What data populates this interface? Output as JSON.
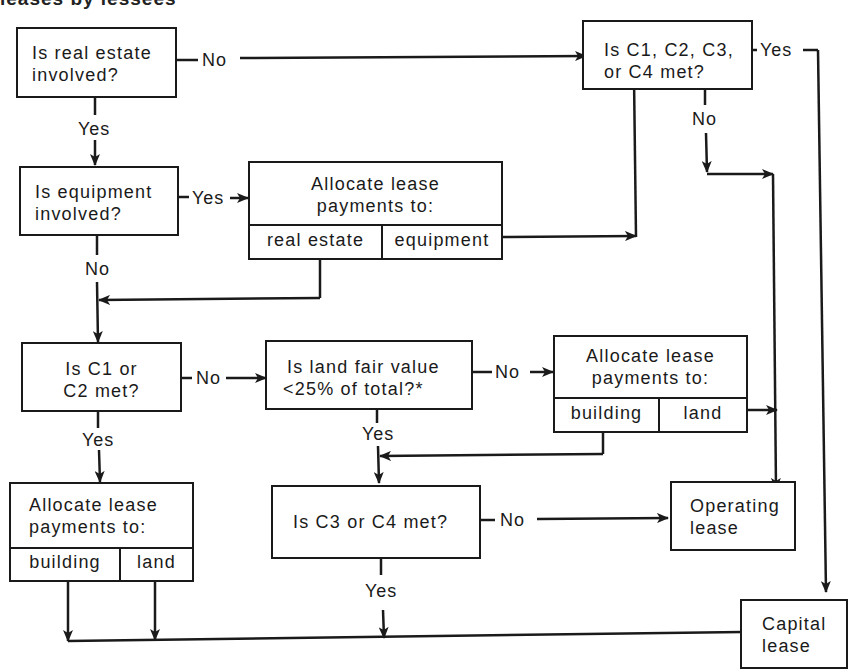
{
  "title_fragment": "leases by lessees",
  "nodes": {
    "real_estate": {
      "line1": "Is real estate",
      "line2": "involved?"
    },
    "c1_c4": {
      "line1": "Is C1, C2, C3,",
      "line2": "or C4 met?"
    },
    "equipment": {
      "line1": "Is equipment",
      "line2": "involved?"
    },
    "alloc_re_eq": {
      "line1": "Allocate lease",
      "line2": "payments to:",
      "cell1": "real estate",
      "cell2": "equipment"
    },
    "c1_c2": {
      "line1": "Is C1 or",
      "line2": "C2 met?"
    },
    "land_value": {
      "line1": "Is land fair value",
      "line2": "<25% of total?*"
    },
    "alloc_bl_right": {
      "line1": "Allocate lease",
      "line2": "payments to:",
      "cell1": "building",
      "cell2": "land"
    },
    "alloc_bl_left": {
      "line1": "Allocate lease",
      "line2": "payments to:",
      "cell1": "building",
      "cell2": "land"
    },
    "c3_c4": {
      "line1": "Is C3 or C4 met?"
    },
    "operating": {
      "line1": "Operating",
      "line2": "lease"
    },
    "capital": {
      "line1": "Capital",
      "line2": "lease"
    }
  },
  "edge_labels": {
    "real_estate_no": "No",
    "real_estate_yes": "Yes",
    "c1_c4_yes": "Yes",
    "c1_c4_no": "No",
    "equipment_yes": "Yes",
    "equipment_no": "No",
    "c1_c2_no": "No",
    "c1_c2_yes": "Yes",
    "land_value_no": "No",
    "land_value_yes": "Yes",
    "c3_c4_no": "No",
    "c3_c4_yes": "Yes"
  },
  "colors": {
    "ink": "#1a1a1a",
    "background": "#ffffff"
  }
}
